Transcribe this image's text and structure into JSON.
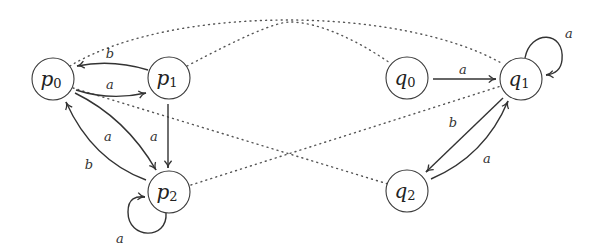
{
  "diagram": {
    "type": "automata-pair-with-relation",
    "nodes": [
      {
        "id": "p0",
        "base": "p",
        "sub": "0",
        "cx": 53,
        "cy": 79
      },
      {
        "id": "p1",
        "base": "p",
        "sub": "1",
        "cx": 169,
        "cy": 78
      },
      {
        "id": "p2",
        "base": "p",
        "sub": "2",
        "cx": 169,
        "cy": 192
      },
      {
        "id": "q0",
        "base": "q",
        "sub": "0",
        "cx": 407,
        "cy": 78
      },
      {
        "id": "q1",
        "base": "q",
        "sub": "1",
        "cx": 521,
        "cy": 79
      },
      {
        "id": "q2",
        "base": "q",
        "sub": "2",
        "cx": 407,
        "cy": 191
      }
    ],
    "edges": [
      {
        "from": "p1",
        "to": "p0",
        "label": "b"
      },
      {
        "from": "p0",
        "to": "p1",
        "label": "a"
      },
      {
        "from": "p0",
        "to": "p2",
        "label": "a"
      },
      {
        "from": "p2",
        "to": "p0",
        "label": "b"
      },
      {
        "from": "p1",
        "to": "p2",
        "label": "a"
      },
      {
        "from": "p2",
        "to": "p2",
        "label": "a"
      },
      {
        "from": "q0",
        "to": "q1",
        "label": "a"
      },
      {
        "from": "q1",
        "to": "q1",
        "label": "a"
      },
      {
        "from": "q1",
        "to": "q2",
        "label": "b"
      },
      {
        "from": "q2",
        "to": "q1",
        "label": "a"
      }
    ],
    "relation_links": [
      {
        "from": "p0",
        "to": "q1",
        "style": "dotted"
      },
      {
        "from": "p1",
        "to": "q0",
        "style": "dotted"
      },
      {
        "from": "p0",
        "to": "q2",
        "style": "dotted"
      },
      {
        "from": "p2",
        "to": "q1",
        "style": "dotted"
      }
    ],
    "labels": {
      "p1_p0": "b",
      "p0_p1": "a",
      "p0_p2": "a",
      "p2_p0": "b",
      "p1_p2": "a",
      "p2_loop": "a",
      "q0_q1": "a",
      "q1_loop": "a",
      "q1_q2": "b",
      "q2_q1": "a"
    },
    "colors": {
      "stroke": "#333333",
      "dotted": "#555555",
      "background": "#ffffff"
    }
  }
}
